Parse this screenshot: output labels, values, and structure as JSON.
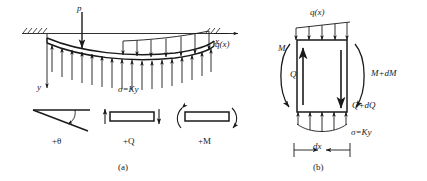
{
  "figure": {
    "panels": [
      {
        "id": "a",
        "caption": "(a)"
      },
      {
        "id": "b",
        "caption": "(b)"
      }
    ]
  },
  "panel_a": {
    "caption": "(a)",
    "point_load_label": "p",
    "distributed_load_label": "q(x)",
    "x_axis_label": "x",
    "y_axis_label": "y",
    "foundation_stress_label": "σ=Ky",
    "conventions": [
      {
        "name": "rotation",
        "label": "+θ"
      },
      {
        "name": "shear",
        "label": "+Q"
      },
      {
        "name": "moment",
        "label": "+M"
      }
    ]
  },
  "panel_b": {
    "caption": "(b)",
    "distributed_load_label": "q(x)",
    "moment_left_label": "M",
    "shear_left_label": "Q",
    "moment_right_label": "M+dM",
    "shear_right_label": "Q+dQ",
    "foundation_stress_label": "σ=Ky",
    "width_label": "dx"
  },
  "colors": {
    "ink": "#1a1a1a",
    "background": "#ffffff"
  }
}
